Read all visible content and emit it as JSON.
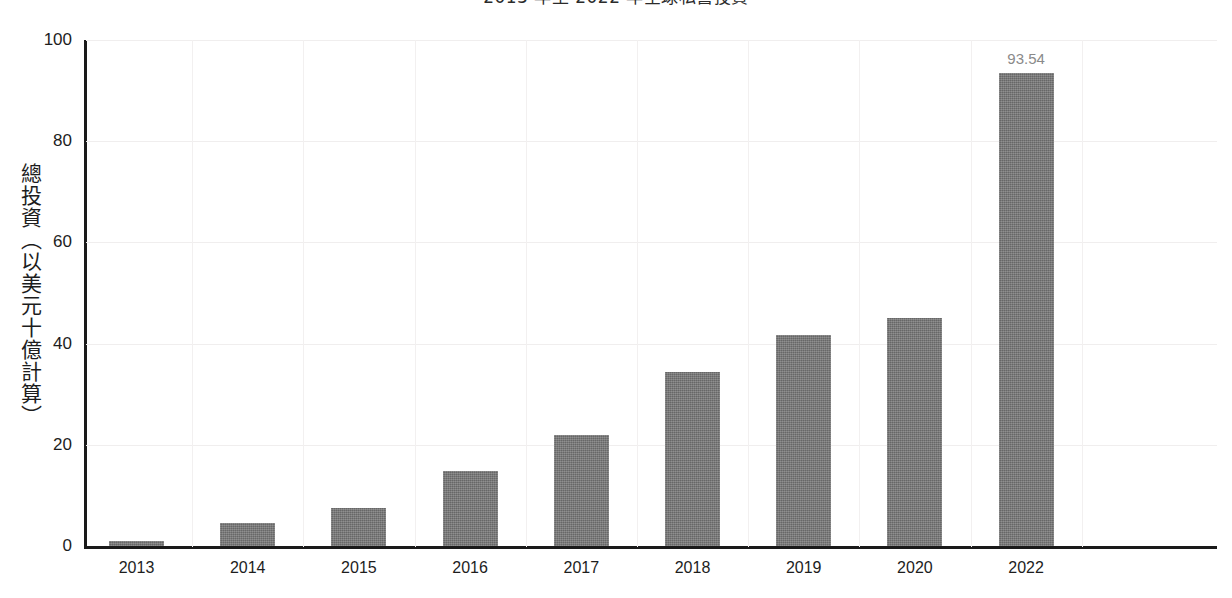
{
  "chart_data": {
    "type": "bar",
    "title": "2013 年至 2022 年全球私營投資",
    "title_clipped": true,
    "xlabel": "",
    "ylabel": "總投資（以美元十億計算）",
    "categories": [
      "2013",
      "2014",
      "2015",
      "2016",
      "2017",
      "2018",
      "2019",
      "2020",
      "2022"
    ],
    "values": [
      1.03,
      4.5,
      7.6,
      14.9,
      22.0,
      34.3,
      41.8,
      45.1,
      93.54
    ],
    "data_labels": [
      "",
      "",
      "",
      "",
      "",
      "",
      "",
      "",
      "93.54"
    ],
    "ylim": [
      0,
      100
    ],
    "yticks": [
      0,
      20,
      40,
      60,
      80,
      100
    ],
    "ytick_labels": [
      "0",
      "20",
      "40",
      "60",
      "80",
      "100"
    ],
    "grid": true,
    "grid_axis": "both",
    "legend": false,
    "legend_position": "none",
    "bar_color": "#767676",
    "label_color": "#8a8a8a",
    "axis_color": "#1a1a1a",
    "grid_color": "#f0eeee",
    "background": "#ffffff"
  }
}
